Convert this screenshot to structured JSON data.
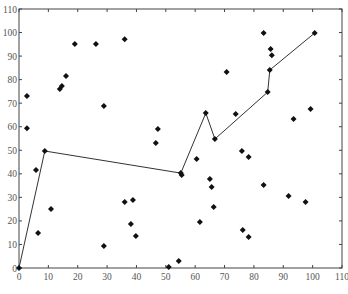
{
  "chart_data": {
    "type": "scatter",
    "title": "",
    "xlabel": "",
    "ylabel": "",
    "xlim": [
      0,
      110
    ],
    "ylim": [
      0,
      110
    ],
    "grid": false,
    "legend": null,
    "x_ticks": [
      0,
      10,
      20,
      30,
      40,
      50,
      60,
      70,
      80,
      90,
      100,
      110
    ],
    "y_ticks": [
      0,
      10,
      20,
      30,
      40,
      50,
      60,
      70,
      80,
      90,
      100,
      110
    ],
    "series": [
      {
        "name": "points",
        "type": "scatter",
        "marker": "diamond",
        "color": "#111111",
        "points": [
          [
            2.7,
            73.0
          ],
          [
            2.7,
            59.4
          ],
          [
            5.8,
            41.6
          ],
          [
            6.5,
            14.9
          ],
          [
            10.9,
            25.1
          ],
          [
            13.9,
            76.0
          ],
          [
            14.6,
            77.3
          ],
          [
            16.0,
            81.5
          ],
          [
            19.0,
            95.1
          ],
          [
            26.2,
            95.1
          ],
          [
            28.9,
            68.8
          ],
          [
            28.9,
            9.3
          ],
          [
            36.0,
            97.2
          ],
          [
            36.0,
            28.0
          ],
          [
            38.8,
            28.9
          ],
          [
            38.1,
            18.7
          ],
          [
            39.8,
            13.6
          ],
          [
            46.6,
            53.1
          ],
          [
            47.3,
            59.0
          ],
          [
            51.0,
            0.4
          ],
          [
            54.4,
            3.0
          ],
          [
            55.4,
            39.5
          ],
          [
            60.5,
            46.3
          ],
          [
            61.6,
            19.5
          ],
          [
            65.0,
            37.8
          ],
          [
            65.6,
            34.4
          ],
          [
            66.3,
            25.9
          ],
          [
            70.7,
            83.2
          ],
          [
            73.8,
            65.4
          ],
          [
            75.9,
            49.7
          ],
          [
            78.2,
            47.1
          ],
          [
            76.2,
            16.1
          ],
          [
            78.2,
            13.2
          ],
          [
            83.3,
            99.8
          ],
          [
            83.3,
            35.2
          ],
          [
            85.7,
            93.0
          ],
          [
            86.1,
            90.4
          ],
          [
            91.8,
            30.6
          ],
          [
            93.5,
            63.3
          ],
          [
            97.6,
            28.0
          ],
          [
            99.3,
            67.5
          ]
        ]
      },
      {
        "name": "path",
        "type": "line",
        "marker": "diamond",
        "color": "#333333",
        "points": [
          [
            0,
            0
          ],
          [
            8.8,
            49.7
          ],
          [
            55.1,
            40.3
          ],
          [
            63.6,
            65.8
          ],
          [
            66.7,
            54.8
          ],
          [
            84.7,
            74.7
          ],
          [
            85.4,
            84.1
          ],
          [
            100.7,
            99.8
          ]
        ]
      }
    ]
  }
}
